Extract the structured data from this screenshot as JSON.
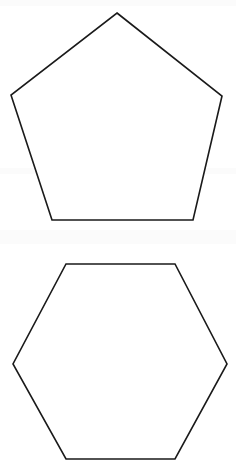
{
  "canvas": {
    "width": 236,
    "height": 463,
    "background_color": "#ffffff",
    "stroke_color": "#1a1a1a",
    "stroke_width": 1.6,
    "fill_color": "#ffffff"
  },
  "figure": {
    "shape_count": 2
  },
  "shapes": [
    {
      "id": "pentagon",
      "name": "pentagon",
      "sides": 5,
      "orientation": "point-up",
      "filled": false,
      "label": "",
      "bbox": {
        "x": 11,
        "y": 13,
        "width": 211,
        "height": 207
      },
      "center": {
        "x": 117,
        "y": 132
      },
      "points": "117,13 222,96 193,220 52,220 11,95",
      "vertices": [
        {
          "x": 117,
          "y": 13,
          "role": "apex"
        },
        {
          "x": 222,
          "y": 96,
          "role": "upper-right"
        },
        {
          "x": 193,
          "y": 220,
          "role": "lower-right"
        },
        {
          "x": 52,
          "y": 220,
          "role": "lower-left"
        },
        {
          "x": 11,
          "y": 95,
          "role": "upper-left"
        }
      ]
    },
    {
      "id": "hexagon",
      "name": "hexagon",
      "sides": 6,
      "orientation": "flat-top",
      "filled": false,
      "label": "",
      "bbox": {
        "x": 13,
        "y": 264,
        "width": 214,
        "height": 195
      },
      "center": {
        "x": 120,
        "y": 361
      },
      "points": "66,264 175,264 227,364 175,459 66,459 13,364",
      "vertices": [
        {
          "x": 66,
          "y": 264,
          "role": "top-left"
        },
        {
          "x": 175,
          "y": 264,
          "role": "top-right"
        },
        {
          "x": 227,
          "y": 364,
          "role": "right"
        },
        {
          "x": 175,
          "y": 459,
          "role": "bottom-right"
        },
        {
          "x": 66,
          "y": 459,
          "role": "bottom-left"
        },
        {
          "x": 13,
          "y": 364,
          "role": "left"
        }
      ]
    }
  ]
}
